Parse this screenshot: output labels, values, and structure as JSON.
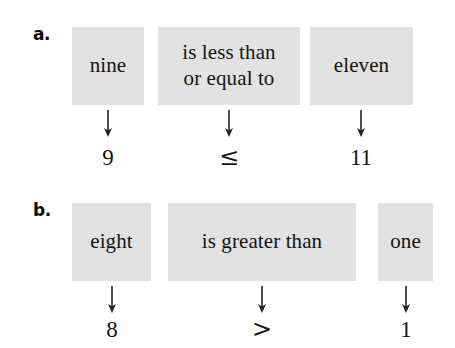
{
  "figure": {
    "background_color": "#ffffff",
    "box_fill_color": "#e2e2e2",
    "text_color": "#141414",
    "arrow_icon_name": "down-arrow-icon",
    "rows": [
      {
        "label": "a.",
        "label_name": "row-label-a",
        "cells": [
          {
            "phrase_lines": [
              "nine"
            ],
            "symbol": "9",
            "is_math_symbol": false
          },
          {
            "phrase_lines": [
              "is less than",
              "or equal to"
            ],
            "symbol": "≤",
            "is_math_symbol": true
          },
          {
            "phrase_lines": [
              "eleven"
            ],
            "symbol": "11",
            "is_math_symbol": false
          }
        ]
      },
      {
        "label": "b.",
        "label_name": "row-label-b",
        "cells": [
          {
            "phrase_lines": [
              "eight"
            ],
            "symbol": "8",
            "is_math_symbol": false
          },
          {
            "phrase_lines": [
              "is greater than"
            ],
            "symbol": ">",
            "is_math_symbol": true
          },
          {
            "phrase_lines": [
              "one"
            ],
            "symbol": "1",
            "is_math_symbol": false
          }
        ]
      }
    ]
  },
  "layout": {
    "rows": [
      {
        "label_x": 33,
        "label_y": 26,
        "box_top": 27,
        "box_height": 78,
        "arrow_y": 110,
        "symbol_y": 146,
        "boxes": [
          {
            "x": 72,
            "w": 72
          },
          {
            "x": 158,
            "w": 142
          },
          {
            "x": 310,
            "w": 103
          }
        ]
      },
      {
        "label_x": 33,
        "label_y": 202,
        "box_top": 203,
        "box_height": 78,
        "arrow_y": 286,
        "symbol_y": 318,
        "boxes": [
          {
            "x": 72,
            "w": 79
          },
          {
            "x": 168,
            "w": 188
          },
          {
            "x": 378,
            "w": 55
          }
        ]
      }
    ]
  }
}
